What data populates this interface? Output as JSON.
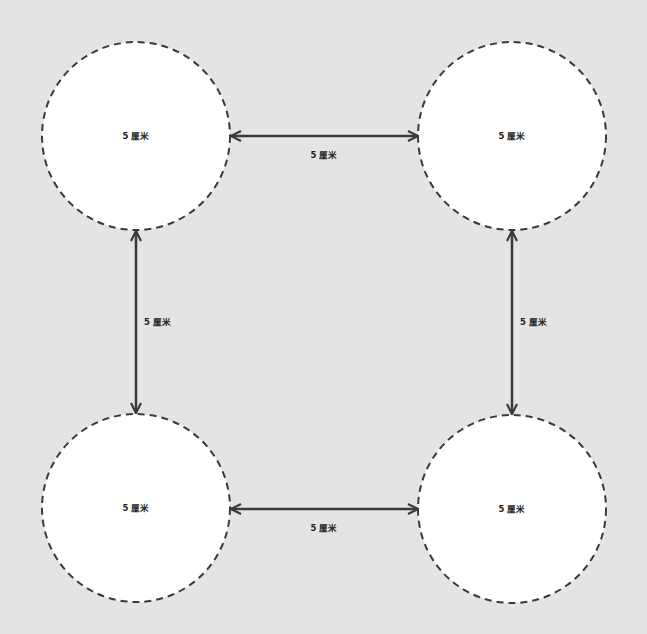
{
  "diagram": {
    "circles": [
      {
        "id": "top-left",
        "label": "5 厘米"
      },
      {
        "id": "top-right",
        "label": "5 厘米"
      },
      {
        "id": "bottom-left",
        "label": "5 厘米"
      },
      {
        "id": "bottom-right",
        "label": "5 厘米"
      }
    ],
    "spacings": [
      {
        "id": "top",
        "label": "5 厘米"
      },
      {
        "id": "left",
        "label": "5 厘米"
      },
      {
        "id": "right",
        "label": "5 厘米"
      },
      {
        "id": "bottom",
        "label": "5 厘米"
      }
    ],
    "colors": {
      "background": "#e4e4e4",
      "circle_fill": "#ffffff",
      "stroke": "#3a3a3a"
    }
  }
}
